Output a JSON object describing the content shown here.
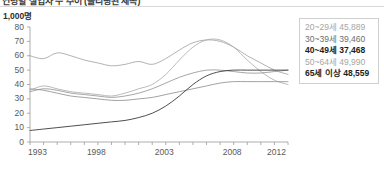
{
  "header": {
    "title": "연령별 실업자 수 추이 (클리핑된 제목)",
    "unit_label": "1,000명"
  },
  "legend": {
    "items": [
      {
        "label": "20~29세",
        "value": "45,889",
        "emphasis": "light",
        "color": "#b3b3b3"
      },
      {
        "label": "30~39세",
        "value": "39,460",
        "emphasis": "mid",
        "color": "#8c8c8c"
      },
      {
        "label": "40~49세",
        "value": "37,468",
        "emphasis": "strong",
        "color": "#1d1d1d"
      },
      {
        "label": "50~64세",
        "value": "49,990",
        "emphasis": "light",
        "color": "#a6a6a6"
      },
      {
        "label": "65세 이상",
        "value": "48,559",
        "emphasis": "strong",
        "color": "#1d1d1d"
      }
    ]
  },
  "chart_data": {
    "type": "line",
    "title": "",
    "xlabel": "",
    "ylabel": "1,000명",
    "ylim": [
      0,
      80
    ],
    "ytick_values": [
      0,
      10,
      20,
      30,
      40,
      50,
      60,
      70,
      80
    ],
    "xlim": [
      1993,
      2012
    ],
    "xtick_labels": [
      "1993",
      "1998",
      "2003",
      "2008",
      "2012"
    ],
    "xtick_values": [
      1993,
      1998,
      2003,
      2008,
      2012
    ],
    "minor_xticks_every": 1,
    "grid": false,
    "legend_position": "right",
    "x": [
      1993,
      1994,
      1995,
      1996,
      1997,
      1998,
      1999,
      2000,
      2001,
      2002,
      2003,
      2004,
      2005,
      2006,
      2007,
      2008,
      2009,
      2010,
      2011,
      2012
    ],
    "series": [
      {
        "name": "20~29세",
        "color": "#9e9e9e",
        "width": 0.8,
        "values": [
          60,
          58,
          62,
          60,
          57,
          55,
          53,
          54,
          56,
          54,
          58,
          64,
          69,
          71,
          70,
          66,
          60,
          55,
          50,
          47
        ]
      },
      {
        "name": "30~39세",
        "color": "#a8a8a8",
        "width": 0.8,
        "values": [
          36,
          39,
          37,
          35,
          34,
          33,
          32,
          34,
          37,
          40,
          47,
          57,
          66,
          71,
          71,
          66,
          57,
          49,
          43,
          40
        ]
      },
      {
        "name": "40~49세",
        "color": "#8f8f8f",
        "width": 0.8,
        "values": [
          35,
          37,
          36,
          34,
          33,
          32,
          31,
          32,
          34,
          37,
          41,
          45,
          48,
          50,
          50,
          49,
          48,
          48,
          49,
          50
        ]
      },
      {
        "name": "50~64세",
        "color": "#8a8a8a",
        "width": 0.8,
        "values": [
          37,
          36,
          34,
          32,
          31,
          30,
          29,
          29,
          30,
          31,
          33,
          35,
          37,
          39,
          41,
          42,
          42,
          42,
          42,
          42
        ]
      },
      {
        "name": "65세 이상",
        "color": "#3a3a3a",
        "width": 0.9,
        "values": [
          8,
          9,
          10,
          11,
          12,
          13,
          14,
          15,
          17,
          20,
          25,
          32,
          40,
          46,
          49,
          50,
          50,
          50,
          50,
          50
        ]
      }
    ]
  }
}
